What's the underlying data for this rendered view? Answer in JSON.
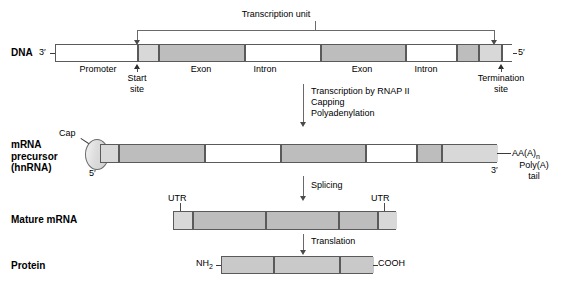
{
  "figure": {
    "title": "Transcription unit",
    "rows": {
      "dna": {
        "label": "DNA",
        "left_end": "3′",
        "right_end": "5′",
        "segment_labels": [
          "Promoter",
          "Exon",
          "Intron",
          "Exon",
          "Intron"
        ],
        "start_site": "Start\nsite",
        "termination_site": "Termination\nsite"
      },
      "precursor": {
        "label": "mRNA\nprecursor\n(hnRNA)",
        "cap": "Cap",
        "five_prime": "5′",
        "three_prime": "3′",
        "poly_a_sequence": "AA(A)",
        "poly_a_subscript": "n",
        "poly_a_tail": "Poly(A)\ntail"
      },
      "mature": {
        "label": "Mature mRNA",
        "utr_left": "UTR",
        "utr_right": "UTR"
      },
      "protein": {
        "label": "Protein",
        "n_terminus": "NH",
        "n_terminus_subscript": "2",
        "c_terminus": "COOH"
      }
    },
    "steps": {
      "transcription": [
        "Transcription by RNAP II",
        "Capping",
        "Polyadenylation"
      ],
      "splicing": "Splicing",
      "translation": "Translation"
    },
    "colors": {
      "background": "#ffffff",
      "outline": "#5a5a5a",
      "exon_fill": "#bdbdbd",
      "utr_fill": "#d8d8d8",
      "intron_fill": "#ffffff",
      "protein_fill": "#c9c9c9",
      "text": "#000000"
    }
  }
}
